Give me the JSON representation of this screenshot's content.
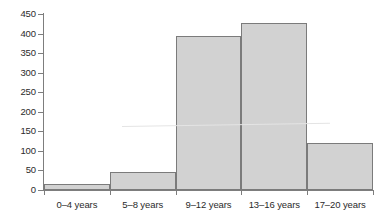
{
  "chart_data": {
    "type": "bar",
    "title": "",
    "subtitle": "",
    "xlabel": "",
    "ylabel": "",
    "categories": [
      "0–4 years",
      "5–8 years",
      "9–12 years",
      "13–16 years",
      "17–20 years"
    ],
    "values": [
      15,
      47,
      395,
      427,
      120
    ],
    "ylim": [
      0,
      450
    ],
    "ytick_labels": [
      "0",
      "50",
      "100",
      "150",
      "200",
      "250",
      "300",
      "350",
      "400",
      "450"
    ],
    "ytick_values": [
      0,
      50,
      100,
      150,
      200,
      250,
      300,
      350,
      400,
      450
    ],
    "grid": false,
    "legend": false,
    "legend_position": "none",
    "bar_fill_color": "#d2d2d2",
    "bar_border_color": "#7b7b7b",
    "axis_color": "#7d7d7d",
    "text_color": "#2b2b2b",
    "background_color": "#ffffff",
    "bar_gap": 0
  }
}
